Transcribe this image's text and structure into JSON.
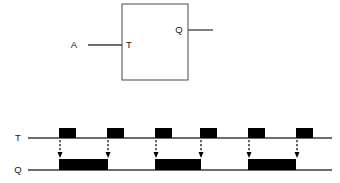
{
  "figure": {
    "background_color": "#ffffff",
    "line_color": "#3c3c3c",
    "pulse_fill_color": "#000000",
    "text_color": "#1a1a1a"
  },
  "block_diagram": {
    "name": "t-flip-flop-block",
    "box": {
      "x": 122,
      "y": 4,
      "width": 66,
      "height": 76,
      "stroke": "#4a4a4a",
      "stroke_width": 1
    },
    "input_port": {
      "label": "T",
      "label_x": 127,
      "label_y": 48,
      "wire_x1": 88,
      "wire_x2": 122,
      "wire_y": 45
    },
    "input_signal": {
      "label": "A",
      "label_x": 74,
      "label_y": 48
    },
    "output_port": {
      "label": "Q",
      "label_x": 175,
      "label_y": 33,
      "wire_x1": 188,
      "wire_x2": 213,
      "wire_y": 30
    }
  },
  "timing_diagram": {
    "name": "timing-waveforms",
    "axis_x_start": 32,
    "axis_x_end": 332,
    "signals": [
      {
        "name": "T",
        "label": "T",
        "label_x": 18,
        "baseline_y": 138,
        "pulse_height": 10,
        "wire_x1": 28,
        "wire_x2": 332,
        "pulses": [
          {
            "start": 59,
            "end": 76
          },
          {
            "start": 107,
            "end": 124
          },
          {
            "start": 155,
            "end": 172
          },
          {
            "start": 200,
            "end": 217
          },
          {
            "start": 248,
            "end": 265
          },
          {
            "start": 296,
            "end": 313
          }
        ]
      },
      {
        "name": "Q",
        "label": "Q",
        "label_x": 18,
        "baseline_y": 170,
        "pulse_height": 11,
        "wire_x1": 28,
        "wire_x2": 332,
        "pulses": [
          {
            "start": 59,
            "end": 108
          },
          {
            "start": 155,
            "end": 201
          },
          {
            "start": 248,
            "end": 296
          }
        ]
      }
    ],
    "trigger_arrows": [
      {
        "x": 60,
        "y_top": 140,
        "y_bottom": 158
      },
      {
        "x": 108,
        "y_top": 140,
        "y_bottom": 158
      },
      {
        "x": 156,
        "y_top": 140,
        "y_bottom": 158
      },
      {
        "x": 201,
        "y_top": 140,
        "y_bottom": 158
      },
      {
        "x": 249,
        "y_top": 140,
        "y_bottom": 158
      },
      {
        "x": 297,
        "y_top": 140,
        "y_bottom": 158
      }
    ],
    "arrow_style": {
      "dash": "2.2,1.8",
      "stroke": "#000000",
      "stroke_width": 1.2,
      "head_width": 5,
      "head_height": 6
    }
  }
}
